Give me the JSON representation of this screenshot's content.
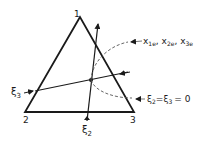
{
  "diagram": {
    "vertices": {
      "v1": "1",
      "v2": "2",
      "v3": "3"
    },
    "axes": {
      "xi3": "ξ",
      "xi3_sub": "3",
      "xi2": "ξ",
      "xi2_sub": "2"
    },
    "annotations": {
      "equilibrium_x1": "x",
      "equilibrium_x1_sub": "1e",
      "equilibrium_x2": "x",
      "equilibrium_x2_sub": "2e",
      "equilibrium_x3": "x",
      "equilibrium_x3_sub": "3e",
      "sep1": ",",
      "sep2": ",",
      "origin_xi2": "ξ",
      "origin_xi2_sub": "2",
      "origin_eq": "=",
      "origin_xi3": "ξ",
      "origin_xi3_sub": "3",
      "origin_eq2": "= 0"
    },
    "colors": {
      "line": "#1a1a1a",
      "dashed": "#555555"
    }
  }
}
